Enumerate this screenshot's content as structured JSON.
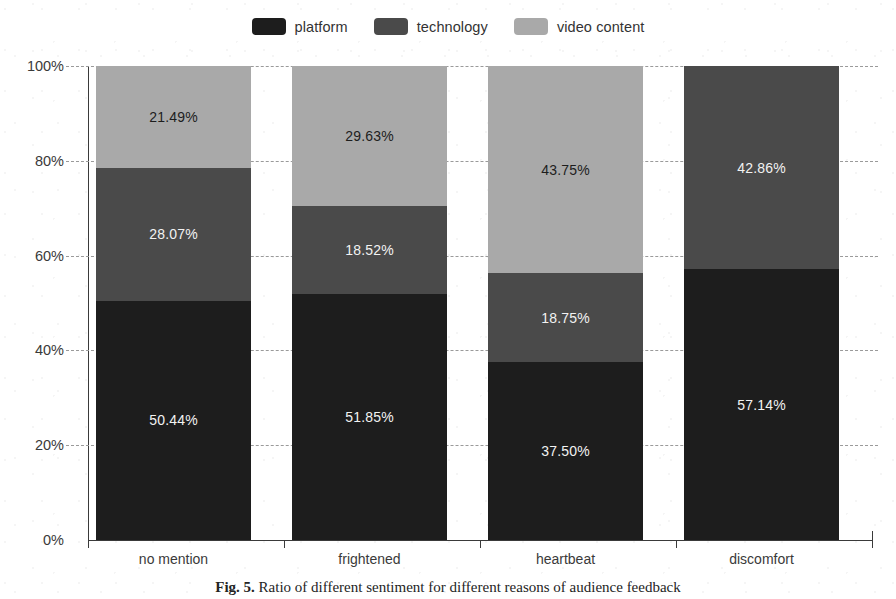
{
  "figure": {
    "caption_prefix": "Fig. 5.",
    "caption_text": "Ratio of different sentiment for different reasons of audience feedback"
  },
  "legend": {
    "position": "top-center",
    "items": [
      {
        "label": "platform",
        "color": "#1d1d1d",
        "swatch_name": "legend-swatch-platform"
      },
      {
        "label": "technology",
        "color": "#4a4a4a",
        "swatch_name": "legend-swatch-technology"
      },
      {
        "label": "video content",
        "color": "#a9a9a9",
        "swatch_name": "legend-swatch-video-content"
      }
    ]
  },
  "axes": {
    "y_ticks": [
      "0%",
      "20%",
      "40%",
      "60%",
      "80%",
      "100%"
    ],
    "y_tick_values": [
      0,
      20,
      40,
      60,
      80,
      100
    ],
    "x_ticks": [
      "no mention",
      "frightened",
      "heartbeat",
      "discomfort"
    ],
    "grid": "horizontal-dashed"
  },
  "chart_data": {
    "type": "bar",
    "stacked": true,
    "normalized": true,
    "title": "",
    "xlabel": "",
    "ylabel": "",
    "ylim": [
      0,
      100
    ],
    "yticks": [
      0,
      20,
      40,
      60,
      80,
      100
    ],
    "ytick_labels": [
      "0%",
      "20%",
      "40%",
      "60%",
      "80%",
      "100%"
    ],
    "grid": true,
    "legend_position": "top-center",
    "categories": [
      "no mention",
      "frightened",
      "heartbeat",
      "discomfort"
    ],
    "series": [
      {
        "name": "platform",
        "color": "#1d1d1d",
        "values": [
          50.44,
          51.85,
          37.5,
          57.14
        ],
        "labels": [
          "50.44%",
          "51.85%",
          "37.50%",
          "57.14%"
        ]
      },
      {
        "name": "technology",
        "color": "#4a4a4a",
        "values": [
          28.07,
          18.52,
          18.75,
          42.86
        ],
        "labels": [
          "28.07%",
          "18.52%",
          "18.75%",
          "42.86%"
        ]
      },
      {
        "name": "video content",
        "color": "#a9a9a9",
        "values": [
          21.49,
          29.63,
          43.75,
          0
        ],
        "labels": [
          "21.49%",
          "29.63%",
          "43.75%",
          ""
        ]
      }
    ]
  },
  "bars": [
    {
      "category": "no mention",
      "segments": [
        {
          "series": "video content",
          "value": 21.49,
          "label": "21.49%",
          "color": "#a9a9a9",
          "text_tone": "dark"
        },
        {
          "series": "technology",
          "value": 28.07,
          "label": "28.07%",
          "color": "#4a4a4a",
          "text_tone": "light"
        },
        {
          "series": "platform",
          "value": 50.44,
          "label": "50.44%",
          "color": "#1d1d1d",
          "text_tone": "light"
        }
      ]
    },
    {
      "category": "frightened",
      "segments": [
        {
          "series": "video content",
          "value": 29.63,
          "label": "29.63%",
          "color": "#a9a9a9",
          "text_tone": "dark"
        },
        {
          "series": "technology",
          "value": 18.52,
          "label": "18.52%",
          "color": "#4a4a4a",
          "text_tone": "light"
        },
        {
          "series": "platform",
          "value": 51.85,
          "label": "51.85%",
          "color": "#1d1d1d",
          "text_tone": "light"
        }
      ]
    },
    {
      "category": "heartbeat",
      "segments": [
        {
          "series": "video content",
          "value": 43.75,
          "label": "43.75%",
          "color": "#a9a9a9",
          "text_tone": "dark"
        },
        {
          "series": "technology",
          "value": 18.75,
          "label": "18.75%",
          "color": "#4a4a4a",
          "text_tone": "light"
        },
        {
          "series": "platform",
          "value": 37.5,
          "label": "37.50%",
          "color": "#1d1d1d",
          "text_tone": "light"
        }
      ]
    },
    {
      "category": "discomfort",
      "segments": [
        {
          "series": "technology",
          "value": 42.86,
          "label": "42.86%",
          "color": "#4a4a4a",
          "text_tone": "light"
        },
        {
          "series": "platform",
          "value": 57.14,
          "label": "57.14%",
          "color": "#1d1d1d",
          "text_tone": "light"
        }
      ]
    }
  ]
}
